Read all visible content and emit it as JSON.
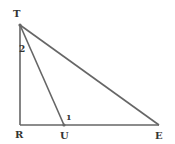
{
  "diagram": {
    "type": "geometry-triangle",
    "points": {
      "T": {
        "label": "T",
        "x": 20,
        "y": 25
      },
      "R": {
        "label": "R",
        "x": 20,
        "y": 125
      },
      "U": {
        "label": "U",
        "x": 64,
        "y": 125
      },
      "E": {
        "label": "E",
        "x": 159,
        "y": 125
      }
    },
    "segments": [
      {
        "from": "T",
        "to": "R"
      },
      {
        "from": "R",
        "to": "E"
      },
      {
        "from": "T",
        "to": "E"
      },
      {
        "from": "T",
        "to": "U"
      }
    ],
    "angle_labels": [
      {
        "label": "2",
        "at": "T",
        "x": 22,
        "y": 51
      },
      {
        "label": "1",
        "at": "U",
        "x": 67,
        "y": 120
      }
    ],
    "line_color": "#666666",
    "label_color": "#333333"
  }
}
